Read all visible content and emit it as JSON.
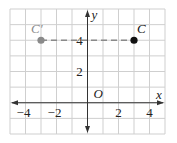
{
  "chart_data": {
    "type": "scatter",
    "title": "",
    "xlabel": "x",
    "ylabel": "y",
    "origin_label": "O",
    "xlim": [
      -5,
      5
    ],
    "ylim": [
      -2,
      6
    ],
    "grid": true,
    "grid_step": 1,
    "x_ticks": [
      -4,
      -2,
      2,
      4
    ],
    "x_tick_labels": [
      "−4",
      "−2",
      "2",
      "4"
    ],
    "y_ticks": [
      2,
      4
    ],
    "y_tick_labels": [
      "2",
      "4"
    ],
    "points": [
      {
        "label": "C'",
        "x": -3,
        "y": 4,
        "color": "#8a8a8a"
      },
      {
        "label": "C",
        "x": 3,
        "y": 4,
        "color": "#111111"
      }
    ],
    "segments": [
      {
        "from": "C'",
        "to": "C",
        "style": "dashed",
        "color": "#8a8a8a"
      }
    ],
    "legend": null
  },
  "colors": {
    "grid": "#cfcfcf",
    "axis": "#333333",
    "image_point": "#8a8a8a",
    "original_point": "#111111"
  }
}
